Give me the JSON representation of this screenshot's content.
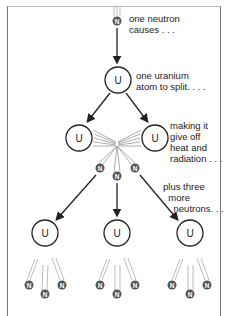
{
  "diagram": {
    "labels": {
      "step1": "one neutron\ncauses . . .",
      "step2": "one uranium\natom to split. . . .",
      "step3": "making it\ngive off\nheat and\nradiation . . .",
      "step4": "plus three\n  more\n    neutrons. . ."
    },
    "nodes": {
      "uranium_symbol": "U",
      "neutron_symbol": "N"
    },
    "structure": {
      "incoming_neutrons": 1,
      "split_fragments": 2,
      "released_neutrons": 3,
      "next_generation_uranium": 3,
      "neutrons_per_next_split": 3
    },
    "colors": {
      "line": "#222222",
      "neutron_fill": "#555555",
      "trail": "#aaaaaa",
      "frame": "#777777"
    }
  }
}
